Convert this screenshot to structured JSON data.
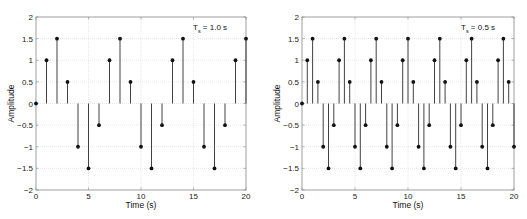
{
  "chart_data": [
    {
      "type": "stem",
      "title": "",
      "annotation": {
        "main": "T",
        "sub": "s",
        "rest": " = 1.0 s"
      },
      "xlabel": "Time (s)",
      "ylabel": "Amplitude",
      "xlim": [
        0,
        20
      ],
      "ylim": [
        -2,
        2
      ],
      "xticks": [
        0,
        5,
        10,
        15,
        20
      ],
      "yticks": [
        -2,
        -1.5,
        -1,
        -0.5,
        0,
        0.5,
        1,
        1.5,
        2
      ],
      "grid": true,
      "x": [
        0,
        1,
        2,
        3,
        4,
        5,
        6,
        7,
        8,
        9,
        10,
        11,
        12,
        13,
        14,
        15,
        16,
        17,
        18,
        19,
        20
      ],
      "values": [
        0,
        1,
        1.5,
        0.5,
        -1,
        -1.5,
        -0.5,
        1,
        1.5,
        0.5,
        -1,
        -1.5,
        -0.5,
        1,
        1.5,
        0.5,
        -1,
        -1.5,
        -0.5,
        1,
        1.5
      ]
    },
    {
      "type": "stem",
      "title": "",
      "annotation": {
        "main": "T",
        "sub": "s",
        "rest": " = 0.5 s"
      },
      "xlabel": "Time (s)",
      "ylabel": "Amplitude",
      "xlim": [
        0,
        20
      ],
      "ylim": [
        -2,
        2
      ],
      "xticks": [
        0,
        5,
        10,
        15,
        20
      ],
      "yticks": [
        -2,
        -1.5,
        -1,
        -0.5,
        0,
        0.5,
        1,
        1.5,
        2
      ],
      "grid": true,
      "x": [
        0,
        0.5,
        1,
        1.5,
        2,
        2.5,
        3,
        3.5,
        4,
        4.5,
        5,
        5.5,
        6,
        6.5,
        7,
        7.5,
        8,
        8.5,
        9,
        9.5,
        10,
        10.5,
        11,
        11.5,
        12,
        12.5,
        13,
        13.5,
        14,
        14.5,
        15,
        15.5,
        16,
        16.5,
        17,
        17.5,
        18,
        18.5,
        19,
        19.5,
        20
      ],
      "values": [
        0,
        1,
        1.5,
        0.5,
        -1,
        -1.5,
        -0.5,
        1,
        1.5,
        0.5,
        -1,
        -1.5,
        -0.5,
        1,
        1.5,
        0.5,
        -1,
        -1.5,
        -0.5,
        1,
        1.5,
        0.5,
        -1,
        -1.5,
        -0.5,
        1,
        1.5,
        0.5,
        -1,
        -1.5,
        -0.5,
        1,
        1.5,
        0.5,
        -1,
        -1.5,
        -0.5,
        1,
        1.5,
        0.5,
        -1
      ]
    }
  ],
  "layout": {
    "plots": [
      {
        "left": 36,
        "right": 246,
        "top": 17,
        "bottom": 190
      },
      {
        "left": 302,
        "right": 514,
        "top": 17,
        "bottom": 190
      }
    ]
  },
  "colors": {
    "stem": "#111111",
    "grid": "#d9d9d9",
    "axis": "#888888"
  }
}
